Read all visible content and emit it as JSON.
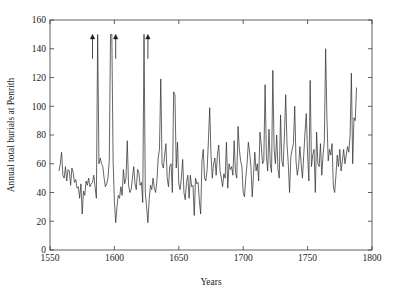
{
  "chart_data": {
    "type": "line",
    "title": "",
    "subtitle": "",
    "xlabel": "Years",
    "ylabel": "Annual total burials at Penrith",
    "xlim": [
      1550,
      1800
    ],
    "ylim": [
      0,
      160
    ],
    "xticks": [
      1550,
      1600,
      1650,
      1700,
      1750,
      1800
    ],
    "xtick_labels": [
      "1550",
      "1600",
      "1650",
      "1700",
      "1750",
      "1800"
    ],
    "yticks": [
      0,
      20,
      40,
      60,
      80,
      100,
      120,
      140,
      160
    ],
    "ytick_labels": [
      "0",
      "20",
      "40",
      "60",
      "80",
      "100",
      "120",
      "140",
      "160"
    ],
    "grid": false,
    "legend": null,
    "legend_position": "none",
    "line_color": "#333333",
    "background_color": "#ffffff",
    "frame_color": "#3a3a3a",
    "annotations": [
      {
        "name": "plague-arrow-1583",
        "x": 1583,
        "y_tip": 150,
        "y_tail": 133,
        "label": "",
        "symbol": "up-arrow"
      },
      {
        "name": "plague-arrow-1601",
        "x": 1601,
        "y_tip": 150,
        "y_tail": 133,
        "label": "",
        "symbol": "up-arrow"
      },
      {
        "name": "plague-arrow-1626",
        "x": 1626,
        "y_tip": 150,
        "y_tail": 133,
        "label": "",
        "symbol": "up-arrow"
      }
    ],
    "note_clipped": "Three peaks exceed the y-axis maximum and are marked with upward arrows",
    "x": [
      1557,
      1558,
      1559,
      1560,
      1561,
      1562,
      1563,
      1564,
      1565,
      1566,
      1567,
      1568,
      1569,
      1570,
      1571,
      1572,
      1573,
      1574,
      1575,
      1576,
      1577,
      1578,
      1579,
      1580,
      1581,
      1582,
      1583,
      1584,
      1585,
      1586,
      1587,
      1588,
      1589,
      1590,
      1591,
      1592,
      1593,
      1594,
      1595,
      1596,
      1597,
      1598,
      1599,
      1600,
      1601,
      1602,
      1603,
      1604,
      1605,
      1606,
      1607,
      1608,
      1609,
      1610,
      1611,
      1612,
      1613,
      1614,
      1615,
      1616,
      1617,
      1618,
      1619,
      1620,
      1621,
      1622,
      1623,
      1624,
      1625,
      1626,
      1627,
      1628,
      1629,
      1630,
      1631,
      1632,
      1633,
      1634,
      1635,
      1636,
      1637,
      1638,
      1639,
      1640,
      1641,
      1642,
      1643,
      1644,
      1645,
      1646,
      1647,
      1648,
      1649,
      1650,
      1651,
      1652,
      1653,
      1654,
      1655,
      1656,
      1657,
      1658,
      1659,
      1660,
      1661,
      1662,
      1663,
      1664,
      1665,
      1666,
      1667,
      1668,
      1669,
      1670,
      1671,
      1672,
      1673,
      1674,
      1675,
      1676,
      1677,
      1678,
      1679,
      1680,
      1681,
      1682,
      1683,
      1684,
      1685,
      1686,
      1687,
      1688,
      1689,
      1690,
      1691,
      1692,
      1693,
      1694,
      1695,
      1696,
      1697,
      1698,
      1699,
      1700,
      1701,
      1702,
      1703,
      1704,
      1705,
      1706,
      1707,
      1708,
      1709,
      1710,
      1711,
      1712,
      1713,
      1714,
      1715,
      1716,
      1717,
      1718,
      1719,
      1720,
      1721,
      1722,
      1723,
      1724,
      1725,
      1726,
      1727,
      1728,
      1729,
      1730,
      1731,
      1732,
      1733,
      1734,
      1735,
      1736,
      1737,
      1738,
      1739,
      1740,
      1741,
      1742,
      1743,
      1744,
      1745,
      1746,
      1747,
      1748,
      1749,
      1750,
      1751,
      1752,
      1753,
      1754,
      1755,
      1756,
      1757,
      1758,
      1759,
      1760,
      1761,
      1762,
      1763,
      1764,
      1765,
      1766,
      1767,
      1768,
      1769,
      1770,
      1771,
      1772,
      1773,
      1774,
      1775,
      1776,
      1777,
      1778,
      1779,
      1780,
      1781,
      1782,
      1783,
      1784,
      1785,
      1786,
      1787,
      1788,
      1789,
      1790,
      1791,
      1792,
      1793,
      1794,
      1795,
      1796,
      1797,
      1798,
      1799,
      1800
    ],
    "y": [
      55,
      60,
      68,
      52,
      50,
      58,
      48,
      56,
      55,
      45,
      57,
      54,
      47,
      49,
      43,
      44,
      36,
      46,
      25,
      41,
      38,
      48,
      45,
      50,
      44,
      46,
      47,
      52,
      44,
      36,
      150,
      60,
      64,
      60,
      58,
      50,
      44,
      46,
      50,
      62,
      150,
      150,
      62,
      34,
      19,
      30,
      38,
      36,
      44,
      38,
      56,
      46,
      50,
      76,
      45,
      40,
      42,
      50,
      58,
      46,
      42,
      56,
      54,
      45,
      47,
      33,
      150,
      40,
      30,
      19,
      35,
      45,
      42,
      50,
      43,
      40,
      48,
      64,
      70,
      119,
      60,
      57,
      66,
      74,
      50,
      44,
      58,
      60,
      40,
      110,
      108,
      57,
      75,
      46,
      42,
      50,
      63,
      40,
      35,
      47,
      52,
      36,
      52,
      44,
      45,
      24,
      50,
      46,
      47,
      34,
      25,
      62,
      70,
      50,
      48,
      56,
      76,
      99,
      66,
      50,
      60,
      64,
      52,
      66,
      73,
      55,
      50,
      44,
      53,
      50,
      75,
      43,
      60,
      56,
      58,
      52,
      76,
      54,
      50,
      86,
      70,
      62,
      58,
      40,
      37,
      50,
      60,
      75,
      68,
      58,
      37,
      52,
      68,
      55,
      60,
      48,
      82,
      73,
      60,
      62,
      115,
      66,
      55,
      84,
      60,
      54,
      125,
      70,
      60,
      80,
      56,
      50,
      94,
      62,
      58,
      80,
      108,
      74,
      60,
      40,
      65,
      70,
      74,
      100,
      62,
      52,
      58,
      72,
      60,
      50,
      66,
      82,
      95,
      66,
      48,
      118,
      58,
      66,
      70,
      40,
      82,
      60,
      58,
      74,
      52,
      66,
      76,
      140,
      92,
      62,
      70,
      66,
      74,
      44,
      40,
      52,
      66,
      58,
      70,
      55,
      62,
      70,
      60,
      66,
      72,
      68,
      80,
      123,
      60,
      92,
      90,
      113
    ],
    "series": [
      {
        "name": "Annual total burials at Penrith",
        "color": "#333333"
      }
    ]
  }
}
